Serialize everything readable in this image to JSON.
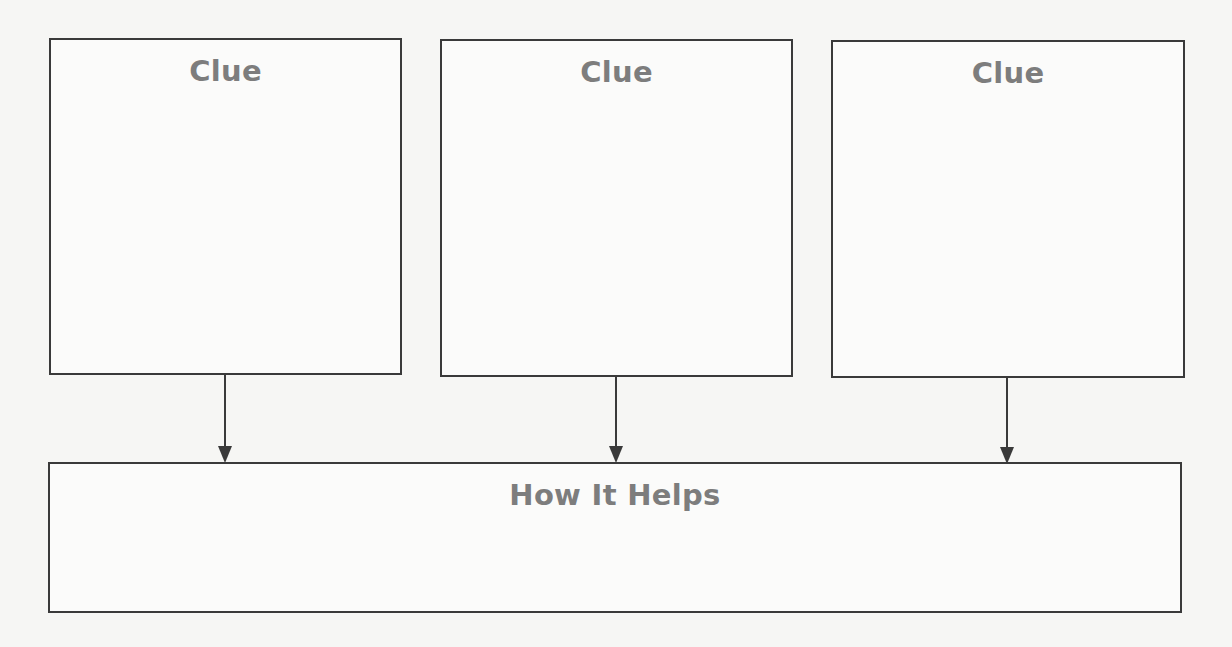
{
  "diagram": {
    "clues": [
      {
        "title": "Clue",
        "body": ""
      },
      {
        "title": "Clue",
        "body": ""
      },
      {
        "title": "Clue",
        "body": ""
      }
    ],
    "result": {
      "title": "How It Helps",
      "body": ""
    },
    "colors": {
      "border": "#3a3a3a",
      "title_text": "#7d7d7d",
      "background": "#f6f6f4"
    }
  }
}
